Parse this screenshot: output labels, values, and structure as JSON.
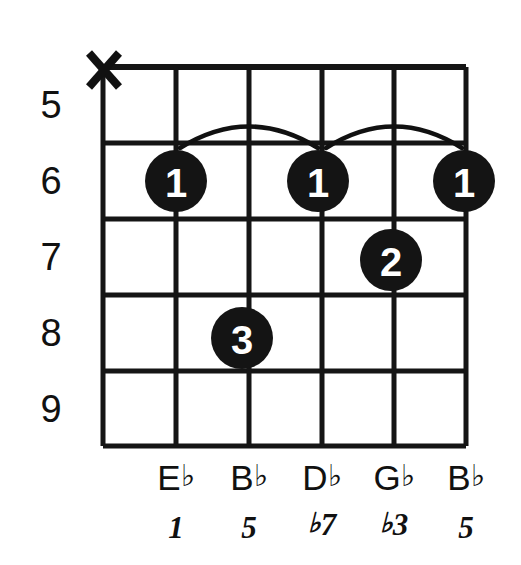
{
  "diagram": {
    "type": "guitar-chord-diagram",
    "strings_count": 6,
    "frets_shown": 5,
    "colors": {
      "ink": "#141414",
      "background": "#ffffff",
      "dot_label": "#ffffff"
    },
    "fret_numbers": [
      {
        "label": "5",
        "fret": 5
      },
      {
        "label": "6",
        "fret": 6
      },
      {
        "label": "7",
        "fret": 7
      },
      {
        "label": "8",
        "fret": 8
      },
      {
        "label": "9",
        "fret": 9
      }
    ],
    "string_markers": [
      {
        "string": 1,
        "symbol": "X",
        "meaning": "muted"
      }
    ],
    "finger_dots": [
      {
        "string": 2,
        "fret": 6,
        "finger": "1"
      },
      {
        "string": 3,
        "fret": 8,
        "finger": "3"
      },
      {
        "string": 4,
        "fret": 6,
        "finger": "1"
      },
      {
        "string": 5,
        "fret": 7,
        "finger": "2"
      },
      {
        "string": 6,
        "fret": 6,
        "finger": "1"
      }
    ],
    "barres": [
      {
        "fret": 6,
        "from_string": 2,
        "to_string": 4
      },
      {
        "fret": 6,
        "from_string": 4,
        "to_string": 6
      }
    ],
    "note_names": [
      {
        "string": 2,
        "letter": "E",
        "accidental": "♭"
      },
      {
        "string": 3,
        "letter": "B",
        "accidental": "♭"
      },
      {
        "string": 4,
        "letter": "D",
        "accidental": "♭"
      },
      {
        "string": 5,
        "letter": "G",
        "accidental": "♭"
      },
      {
        "string": 6,
        "letter": "B",
        "accidental": "♭"
      }
    ],
    "intervals": [
      {
        "string": 2,
        "accidental": "",
        "degree": "1"
      },
      {
        "string": 3,
        "accidental": "",
        "degree": "5"
      },
      {
        "string": 4,
        "accidental": "♭",
        "degree": "7"
      },
      {
        "string": 5,
        "accidental": "♭",
        "degree": "3"
      },
      {
        "string": 6,
        "accidental": "",
        "degree": "5"
      }
    ]
  }
}
